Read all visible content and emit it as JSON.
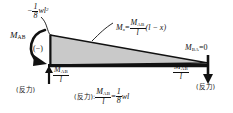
{
  "diagram": {
    "type": "bending-moment-diagram",
    "title": "",
    "colors": {
      "fill": "#c9c9c9",
      "stroke": "#111111",
      "background": "#ffffff"
    },
    "geometry": {
      "baseline_y": 66,
      "left_x": 50,
      "right_x": 208,
      "peak_height": 30
    }
  },
  "labels": {
    "peak_moment": {
      "sign": "−",
      "num": "1",
      "den": "8",
      "tail": "wl",
      "exp": "2",
      "full": "−1/8 wl²"
    },
    "end_moment_left": {
      "symbol": "M",
      "subscript": "AB",
      "full": "M_AB"
    },
    "sign_marker": "(−)",
    "moment_function": {
      "lhs": "M",
      "lhs_sub": "x",
      "eq": "=",
      "num": "M",
      "num_sub": "AB",
      "den": "l",
      "tail": "(l − x)",
      "full": "Mₓ = M_AB / l · (l − x)"
    },
    "end_moment_right": {
      "symbol": "M",
      "subscript": "BA",
      "eq": "=0",
      "full": "M_BA=0"
    },
    "reaction_left": {
      "num": "M",
      "num_sub": "AB",
      "den": "l",
      "caption": "(反力)",
      "full": "M_AB / l (反力)"
    },
    "reaction_right": {
      "num": "M",
      "num_sub": "AB",
      "den": "l",
      "caption": "(反力)",
      "full": "M_AB / l (反力)"
    },
    "reaction_equation": {
      "prefix": "(反力):",
      "num": "M",
      "num_sub": "AB",
      "den": "l",
      "eq": "=",
      "rnum": "1",
      "rden": "8",
      "tail": "wl",
      "full": "(反力): M_AB / l = 1/8 wl"
    }
  },
  "arrows": {
    "moment_arc": "counterclockwise-moment-arrow",
    "left_reaction": "up-arrow",
    "right_reaction": "down-arrow",
    "leader_wl2": "curved-leader-line",
    "leader_mx": "leader-line"
  }
}
